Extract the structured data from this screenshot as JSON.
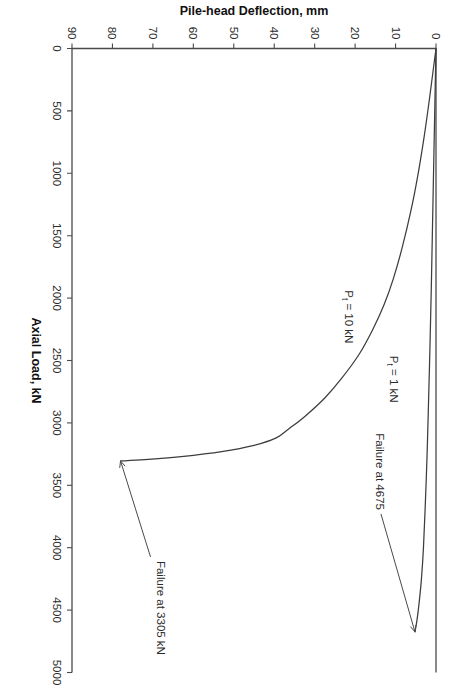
{
  "figure": {
    "rotation_degrees": 90,
    "background_color": "#ffffff",
    "frame_color": "#4a4a4a"
  },
  "chart_data": {
    "type": "line",
    "title": "",
    "xlabel": "Axial Load, kN",
    "ylabel": "Pile-head Deflection, mm",
    "xlim": [
      0,
      5000
    ],
    "ylim": [
      0,
      90
    ],
    "y_axis_inverted": true,
    "grid": false,
    "legend": "none (inline series labels)",
    "xticks": [
      0,
      500,
      1000,
      1500,
      2000,
      2500,
      3000,
      3500,
      4000,
      4500,
      5000
    ],
    "xticklabels": [
      "0",
      "500",
      "1000",
      "1500",
      "2000",
      "2500",
      "3000",
      "3500",
      "4000",
      "4500",
      "5000"
    ],
    "yticks": [
      0,
      10,
      20,
      30,
      40,
      50,
      60,
      70,
      80,
      90
    ],
    "yticklabels": [
      "0",
      "10",
      "20",
      "30",
      "40",
      "50",
      "60",
      "70",
      "80",
      "90"
    ],
    "series": [
      {
        "name": "Pt = 10 kN",
        "label_text": "P",
        "label_subscript": "t",
        "label_rest": " = 10 kN",
        "failure_load_kN": 3305,
        "failure_deflection_mm": 78,
        "x": [
          0,
          150,
          400,
          700,
          1000,
          1300,
          1600,
          1850,
          2050,
          2250,
          2450,
          2650,
          2800,
          2950,
          3050,
          3120,
          3180,
          3230,
          3270,
          3295,
          3305
        ],
        "y": [
          0,
          0.6,
          1.6,
          2.9,
          4.4,
          6.2,
          8.4,
          10.6,
          12.8,
          15.6,
          19.0,
          23.5,
          27.5,
          32.5,
          36.5,
          39.5,
          45.0,
          53.0,
          63.0,
          72.0,
          78.0
        ]
      },
      {
        "name": "Pt = 1 kN",
        "label_text": "P",
        "label_subscript": "t",
        "label_rest": " = 1 kN",
        "failure_load_kN": 4675,
        "failure_deflection_mm": 5.2,
        "x": [
          0,
          400,
          900,
          1400,
          1900,
          2400,
          2900,
          3300,
          3700,
          4000,
          4250,
          4450,
          4580,
          4675
        ],
        "y": [
          0,
          0.25,
          0.55,
          0.85,
          1.15,
          1.5,
          1.9,
          2.25,
          2.7,
          3.1,
          3.6,
          4.2,
          4.7,
          5.2
        ]
      }
    ],
    "annotations": [
      {
        "id": "failure-3305",
        "text": "Failure at 3305 kN",
        "points_to_series": "Pt = 10 kN",
        "points_to_x": 3305,
        "points_to_y": 78
      },
      {
        "id": "failure-4675",
        "text": "Failure at 4675",
        "points_to_series": "Pt = 1 kN",
        "points_to_x": 4675,
        "points_to_y": 5.2
      }
    ]
  }
}
